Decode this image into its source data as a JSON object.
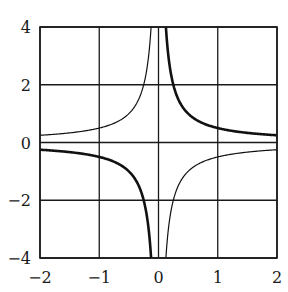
{
  "chart_data": {
    "type": "line",
    "title": "",
    "xlabel": "",
    "ylabel": "",
    "xlim": [
      -2,
      2
    ],
    "ylim": [
      -4,
      4
    ],
    "grid": true,
    "legend": null,
    "x_ticks": [
      -2,
      -1,
      0,
      1,
      2
    ],
    "y_ticks": [
      -4,
      -2,
      0,
      2,
      4
    ],
    "x_tick_labels": [
      "−2",
      "−1",
      "0",
      "1",
      "2"
    ],
    "y_tick_labels": [
      "−4",
      "−2",
      "0",
      "2",
      "4"
    ],
    "series": [
      {
        "name": "y = 1/(2x)",
        "style": "thick",
        "formula": "1/(2x)",
        "x": [
          -2,
          -1.5,
          -1,
          -0.75,
          -0.5,
          -0.375,
          -0.25,
          -0.2,
          -0.15,
          -0.125,
          0.125,
          0.15,
          0.2,
          0.25,
          0.375,
          0.5,
          0.75,
          1,
          1.5,
          2
        ],
        "y": [
          -0.25,
          -0.333,
          -0.5,
          -0.667,
          -1,
          -1.333,
          -2,
          -2.5,
          -3.333,
          -4,
          4,
          3.333,
          2.5,
          2,
          1.333,
          1,
          0.667,
          0.5,
          0.333,
          0.25
        ]
      },
      {
        "name": "y = -1/(2x)",
        "style": "thin",
        "formula": "-1/(2x)",
        "x": [
          -2,
          -1.5,
          -1,
          -0.75,
          -0.5,
          -0.375,
          -0.25,
          -0.2,
          -0.15,
          -0.125,
          0.125,
          0.15,
          0.2,
          0.25,
          0.375,
          0.5,
          0.75,
          1,
          1.5,
          2
        ],
        "y": [
          0.25,
          0.333,
          0.5,
          0.667,
          1,
          1.333,
          2,
          2.5,
          3.333,
          4,
          -4,
          -3.333,
          -2.5,
          -2,
          -1.333,
          -1,
          -0.667,
          -0.5,
          -0.333,
          -0.25
        ]
      }
    ]
  },
  "style": {
    "line_color": "#111111",
    "grid_color": "#1a1a1a",
    "background": "#ffffff",
    "thick_width": 2.6,
    "thin_width": 1.2
  }
}
